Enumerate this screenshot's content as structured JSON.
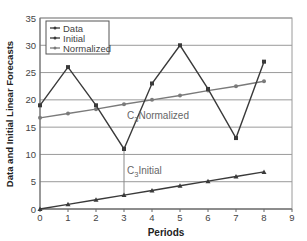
{
  "chart_data": {
    "type": "line",
    "title": "",
    "xlabel": "Periods",
    "ylabel": "Data and Initial Linear Forecasts",
    "xlim": [
      0,
      9
    ],
    "ylim": [
      0,
      35
    ],
    "x_ticks": [
      0,
      1,
      2,
      3,
      4,
      5,
      6,
      7,
      8,
      9
    ],
    "y_ticks": [
      0,
      5,
      10,
      15,
      20,
      25,
      30,
      35
    ],
    "grid": "horizontal",
    "legend_position": "top-left inside",
    "x": [
      0,
      1,
      2,
      3,
      4,
      5,
      6,
      7,
      8
    ],
    "series": [
      {
        "name": "Data",
        "color": "#3a3a3a",
        "values": [
          19,
          26,
          19,
          11,
          23,
          30,
          22,
          13,
          27
        ]
      },
      {
        "name": "Initial",
        "color": "#3a3a3a",
        "values": [
          0,
          0.85,
          1.7,
          2.55,
          3.4,
          4.25,
          5.1,
          5.95,
          6.8
        ]
      },
      {
        "name": "Normalized",
        "color": "#7a7a7a",
        "values": [
          16.7,
          17.5,
          18.3,
          19.2,
          20.0,
          20.8,
          21.7,
          22.5,
          23.4
        ]
      }
    ],
    "annotations": [
      {
        "text_main": "C",
        "text_sub": "3",
        "text_rest": "Normalized",
        "x": 3,
        "y": 16.5
      },
      {
        "text_main": "C",
        "text_sub": "3",
        "text_rest": "Initial",
        "x": 3,
        "y": 6.5
      }
    ],
    "reference_line": {
      "x": 3,
      "y_from": 2.55,
      "y_to": 11.5
    }
  }
}
